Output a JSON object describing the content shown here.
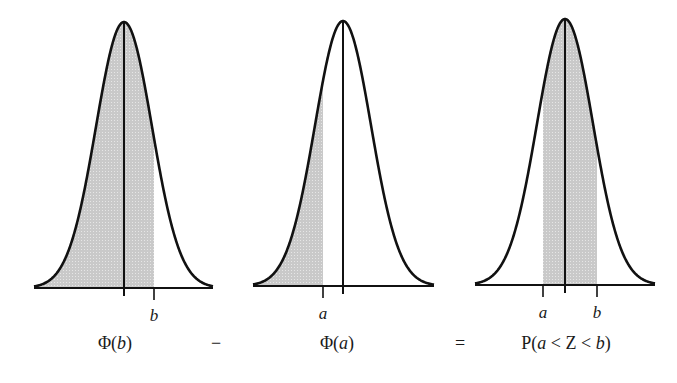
{
  "chart_data": {
    "type": "area",
    "title": "",
    "panels": [
      {
        "name": "phi-b",
        "center_x": 124,
        "baseline_y": 288,
        "peak_y": 22,
        "x_left": 34,
        "x_right": 213,
        "sigma_px": 28,
        "shade_from": "left-tail",
        "shade_to_x": 154,
        "ticks": [
          {
            "label": "b",
            "x": 154
          }
        ],
        "caption": "Φ(b)"
      },
      {
        "name": "phi-a",
        "center_x": 343,
        "baseline_y": 286,
        "peak_y": 21,
        "x_left": 253,
        "x_right": 434,
        "sigma_px": 28,
        "shade_from": "left-tail",
        "shade_to_x": 323,
        "ticks": [
          {
            "label": "a",
            "x": 323
          }
        ],
        "caption": "Φ(a)"
      },
      {
        "name": "prob-a-to-b",
        "center_x": 565,
        "baseline_y": 285,
        "peak_y": 19,
        "x_left": 475,
        "x_right": 655,
        "sigma_px": 28,
        "shade_from_x": 543,
        "shade_to_x": 597,
        "ticks": [
          {
            "label": "a",
            "x": 543
          },
          {
            "label": "b",
            "x": 597
          }
        ],
        "caption": "P(a < Z < b)"
      }
    ],
    "operators": [
      "−",
      "="
    ],
    "colors": {
      "curve": "#111111",
      "shade": "#c8c8c8",
      "axis": "#111111"
    }
  },
  "labels": {
    "panel1_tick_b": "b",
    "panel2_tick_a": "a",
    "panel3_tick_a": "a",
    "panel3_tick_b": "b",
    "caption1_prefix": "Φ(",
    "caption1_var": "b",
    "caption1_suffix": ")",
    "minus": "−",
    "caption2_prefix": "Φ(",
    "caption2_var": "a",
    "caption2_suffix": ")",
    "equals": "=",
    "caption3_p": "P(",
    "caption3_a": "a",
    "caption3_mid": " < Z < ",
    "caption3_b": "b",
    "caption3_close": ")"
  }
}
